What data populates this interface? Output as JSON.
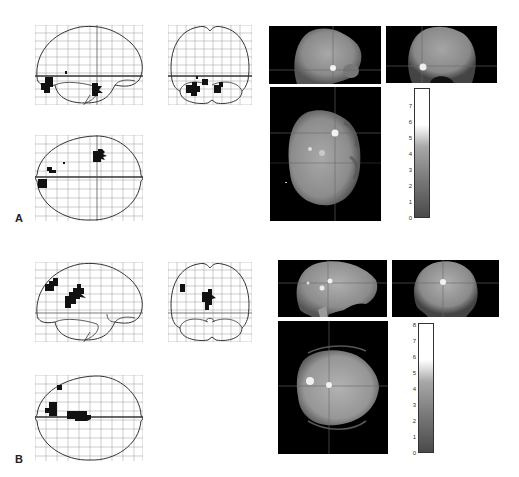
{
  "figure": {
    "panels": [
      {
        "label": "A",
        "glass_brain": {
          "views": [
            "sagittal",
            "coronal",
            "transverse"
          ],
          "grid": "10x10"
        },
        "slices": {
          "views": [
            "sagittal",
            "coronal",
            "axial"
          ]
        },
        "colorbar": {
          "min": 0,
          "max": 7,
          "ticks": [
            "0",
            "1",
            "2",
            "3",
            "4",
            "5",
            "6",
            "7"
          ]
        }
      },
      {
        "label": "B",
        "glass_brain": {
          "views": [
            "sagittal",
            "coronal",
            "transverse"
          ],
          "grid": "10x10"
        },
        "slices": {
          "views": [
            "sagittal",
            "coronal",
            "axial"
          ]
        },
        "colorbar": {
          "min": 0,
          "max": 8,
          "ticks": [
            "0",
            "1",
            "2",
            "3",
            "4",
            "5",
            "6",
            "7",
            "8"
          ]
        }
      }
    ]
  }
}
